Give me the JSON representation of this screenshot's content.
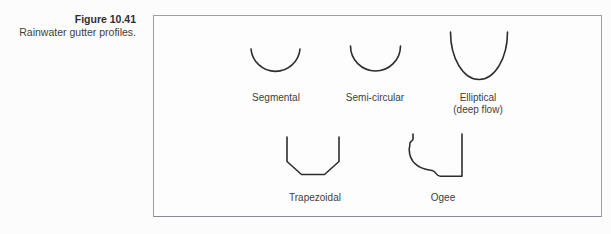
{
  "colors": {
    "background": "#fcfcfc",
    "box_border": "#9e9e9e",
    "profile_stroke": "#2d2d2f",
    "text": "#3e3e40"
  },
  "caption": {
    "figure_label": "Figure 10.41",
    "figure_title": "Rainwater gutter profiles."
  },
  "diagram": {
    "profiles": [
      {
        "id": "segmental",
        "label": "Segmental"
      },
      {
        "id": "semi-circular",
        "label": "Semi-circular"
      },
      {
        "id": "elliptical",
        "label": "Elliptical",
        "label_line2": "(deep flow)"
      },
      {
        "id": "trapezoidal",
        "label": "Trapezoidal"
      },
      {
        "id": "ogee",
        "label": "Ogee"
      }
    ]
  }
}
